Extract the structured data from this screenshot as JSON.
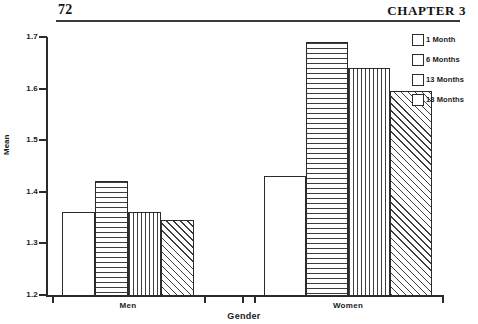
{
  "page": {
    "folio": "72",
    "chapter_title": "CHAPTER 3"
  },
  "legend": {
    "items": [
      {
        "label": "1 Month",
        "pattern": "none"
      },
      {
        "label": "6 Months",
        "pattern": "horiz"
      },
      {
        "label": "13 Months",
        "pattern": "vert"
      },
      {
        "label": "18 Months",
        "pattern": "diag"
      }
    ]
  },
  "axes": {
    "y_label": "Mean",
    "x_label": "Gender",
    "y_ticks": [
      "1.2",
      "1.3",
      "1.4",
      "1.5",
      "1.6",
      "1.7"
    ],
    "group_labels": [
      "Men",
      "Women"
    ]
  },
  "chart_data": {
    "type": "bar",
    "title": "",
    "xlabel": "Gender",
    "ylabel": "Mean",
    "categories": [
      "Men",
      "Women"
    ],
    "series": [
      {
        "name": "1 Month",
        "pattern": "none",
        "values": [
          1.36,
          1.43
        ]
      },
      {
        "name": "6 Months",
        "pattern": "horiz",
        "values": [
          1.42,
          1.69
        ]
      },
      {
        "name": "13 Months",
        "pattern": "vert",
        "values": [
          1.36,
          1.64
        ]
      },
      {
        "name": "18 Months",
        "pattern": "diag",
        "values": [
          1.345,
          1.595
        ]
      }
    ],
    "ylim": [
      1.2,
      1.7
    ],
    "ytick_step": 0.1,
    "grid": false,
    "legend_position": "top-right"
  }
}
